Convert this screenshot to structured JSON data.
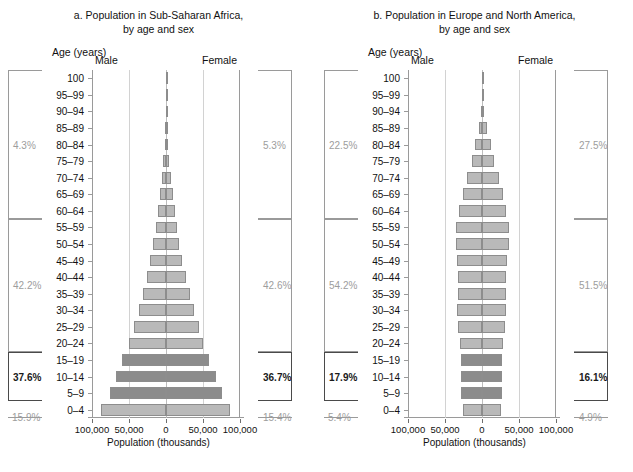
{
  "axis": {
    "title": "Population (thousands)",
    "tick_labels": [
      "100,000",
      "50,000",
      "0",
      "50,000",
      "100,000"
    ],
    "tick_values": [
      -100000,
      -50000,
      0,
      50000,
      100000
    ],
    "xlim": [
      -100000,
      100000
    ]
  },
  "age_header": "Age (years)",
  "sex_labels": {
    "male": "Male",
    "female": "Female"
  },
  "age_groups": [
    "100",
    "95–99",
    "90–94",
    "85–89",
    "80–84",
    "75–79",
    "70–74",
    "65–69",
    "60–64",
    "55–59",
    "50–54",
    "45–49",
    "40–44",
    "35–39",
    "30–34",
    "25–29",
    "20–24",
    "15–19",
    "10–14",
    "5–9",
    "0–4"
  ],
  "colors": {
    "bar_light": "#b9b9b9",
    "bar_dark": "#8c8c8c",
    "bar_outline": "#8d8d8d",
    "gridline": "#d2d2d2",
    "frame": "#9a9a9a",
    "pct_muted": "#9d9d9d",
    "pct_strong": "#1a1a1a"
  },
  "chart_data": [
    {
      "type": "bar",
      "id": "a",
      "title": "a. Population in Sub-Saharan Africa,",
      "subtitle": "by age and sex",
      "xlabel": "Population (thousands)",
      "ylabel": "Age (years)",
      "orientation": "population-pyramid",
      "xlim": [
        -100000,
        100000
      ],
      "grid": true,
      "legend": "none",
      "categories": [
        "0–4",
        "5–9",
        "10–14",
        "15–19",
        "20–24",
        "25–29",
        "30–34",
        "35–39",
        "40–44",
        "45–49",
        "50–54",
        "55–59",
        "60–64",
        "65–69",
        "70–74",
        "75–79",
        "80–84",
        "85–89",
        "90–94",
        "95–99",
        "100"
      ],
      "series": [
        {
          "name": "Male",
          "values": [
            88000,
            76000,
            68000,
            59000,
            50000,
            43000,
            37000,
            31000,
            26000,
            21000,
            17000,
            13500,
            10500,
            7800,
            5500,
            3500,
            2000,
            900,
            300,
            80,
            12
          ]
        },
        {
          "name": "Female",
          "values": [
            86000,
            75000,
            67000,
            58000,
            50000,
            44000,
            38000,
            32000,
            27000,
            22000,
            18000,
            14500,
            11500,
            8800,
            6300,
            4200,
            2500,
            1200,
            420,
            110,
            18
          ]
        }
      ],
      "highlighted_categories": [
        "5–9",
        "10–14",
        "15–19"
      ],
      "brackets": {
        "left": [
          {
            "label": "4.3%",
            "from": "60–64",
            "to": "100",
            "emphasis": "muted"
          },
          {
            "label": "42.2%",
            "from": "20–24",
            "to": "55–59",
            "emphasis": "muted"
          },
          {
            "label": "37.6%",
            "from": "5–9",
            "to": "15–19",
            "emphasis": "strong"
          },
          {
            "label": "15.9%",
            "from": "0–4",
            "to": "0–4",
            "emphasis": "muted"
          }
        ],
        "right": [
          {
            "label": "5.3%",
            "from": "60–64",
            "to": "100",
            "emphasis": "muted"
          },
          {
            "label": "42.6%",
            "from": "20–24",
            "to": "55–59",
            "emphasis": "muted"
          },
          {
            "label": "36.7%",
            "from": "5–9",
            "to": "15–19",
            "emphasis": "strong"
          },
          {
            "label": "15.4%",
            "from": "0–4",
            "to": "0–4",
            "emphasis": "muted"
          }
        ]
      }
    },
    {
      "type": "bar",
      "id": "b",
      "title": "b. Population in Europe and North America,",
      "subtitle": "by age and sex",
      "xlabel": "Population (thousands)",
      "ylabel": "Age (years)",
      "orientation": "population-pyramid",
      "xlim": [
        -100000,
        100000
      ],
      "grid": true,
      "legend": "none",
      "categories": [
        "0–4",
        "5–9",
        "10–14",
        "15–19",
        "20–24",
        "25–29",
        "30–34",
        "35–39",
        "40–44",
        "45–49",
        "50–54",
        "55–59",
        "60–64",
        "65–69",
        "70–74",
        "75–79",
        "80–84",
        "85–89",
        "90–94",
        "95–99",
        "100"
      ],
      "series": [
        {
          "name": "Male",
          "values": [
            26000,
            28000,
            28500,
            28500,
            29500,
            32000,
            33500,
            33000,
            32500,
            34000,
            35500,
            35000,
            31000,
            26000,
            20000,
            13500,
            9000,
            4500,
            1700,
            400,
            40
          ]
        },
        {
          "name": "Female",
          "values": [
            25000,
            26500,
            27000,
            27500,
            28500,
            31000,
            32500,
            32500,
            32500,
            34000,
            36000,
            36000,
            32500,
            28000,
            22500,
            16000,
            11500,
            6500,
            2800,
            750,
            90
          ]
        }
      ],
      "highlighted_categories": [
        "5–9",
        "10–14",
        "15–19"
      ],
      "brackets": {
        "left": [
          {
            "label": "22.5%",
            "from": "60–64",
            "to": "100",
            "emphasis": "muted"
          },
          {
            "label": "54.2%",
            "from": "20–24",
            "to": "55–59",
            "emphasis": "muted"
          },
          {
            "label": "17.9%",
            "from": "5–9",
            "to": "15–19",
            "emphasis": "strong"
          },
          {
            "label": "5.4%",
            "from": "0–4",
            "to": "0–4",
            "emphasis": "muted"
          }
        ],
        "right": [
          {
            "label": "27.5%",
            "from": "60–64",
            "to": "100",
            "emphasis": "muted"
          },
          {
            "label": "51.5%",
            "from": "20–24",
            "to": "55–59",
            "emphasis": "muted"
          },
          {
            "label": "16.1%",
            "from": "5–9",
            "to": "15–19",
            "emphasis": "strong"
          },
          {
            "label": "4.9%",
            "from": "0–4",
            "to": "0–4",
            "emphasis": "muted"
          }
        ]
      }
    }
  ]
}
